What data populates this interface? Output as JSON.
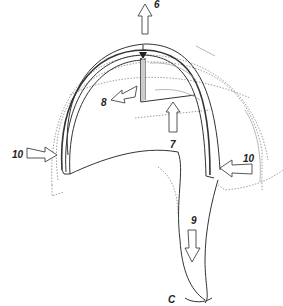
{
  "figure": {
    "labels": {
      "arrow_up": "6",
      "arrow_inner_up": "7",
      "arrow_left": "8",
      "arrow_down": "9",
      "arrow_left_side": "10",
      "arrow_right_side": "10",
      "bottom_label": "C"
    }
  }
}
